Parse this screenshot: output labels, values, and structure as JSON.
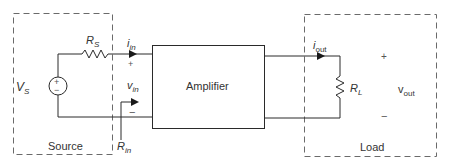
{
  "diagram": {
    "blocks": {
      "source": {
        "label": "Source"
      },
      "amplifier": {
        "label": "Amplifier"
      },
      "load": {
        "label": "Load"
      }
    },
    "components": {
      "voltage_source": {
        "symbol": "V",
        "subscript": "S",
        "plus": "+",
        "minus": "−"
      },
      "source_resistor": {
        "symbol": "R",
        "subscript": "S"
      },
      "load_resistor": {
        "symbol": "R",
        "subscript": "L"
      }
    },
    "quantities": {
      "input_current": {
        "symbol": "i",
        "subscript": "in"
      },
      "input_voltage": {
        "symbol": "v",
        "subscript": "in",
        "plus": "+",
        "minus": "−"
      },
      "input_resistance": {
        "symbol": "R",
        "subscript": "in"
      },
      "output_current": {
        "symbol": "i",
        "subscript": "out"
      },
      "output_voltage": {
        "symbol": "v",
        "subscript": "out",
        "plus": "+",
        "minus": "−"
      }
    },
    "colors": {
      "line": "#2a2a2a",
      "dashed_box": "#6a6a6a",
      "text": "#333333"
    }
  }
}
